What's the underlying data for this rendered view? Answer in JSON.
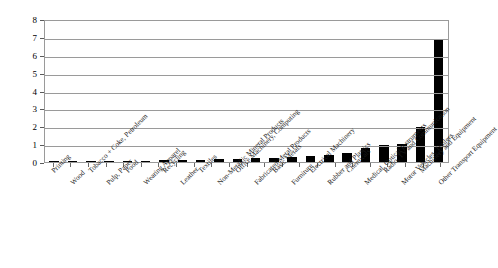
{
  "chart_data": {
    "type": "bar",
    "title": "",
    "subtitle": "",
    "xlabel": "",
    "ylabel": "",
    "ylim": [
      0,
      8
    ],
    "ytick_labels": [
      "8",
      "7",
      "6",
      "5",
      "4",
      "3",
      "2",
      "1",
      "0"
    ],
    "yticks": [
      8,
      7,
      6,
      5,
      4,
      3,
      2,
      1,
      0
    ],
    "grid": true,
    "legend": "none",
    "bar_color": "#000000",
    "categories": [
      "Printing",
      "Wood",
      "Tobacco + Coke, Petroleum",
      "Pulp, Paper",
      "Food",
      "Wearing Apparel",
      "Recycling",
      "Leather",
      "Textiles",
      "Non-Metallic Mineral Products",
      "Office Machinery, Computing",
      "Fabricated Metal Products",
      "Basic Metals",
      "Furniture",
      "Electrical Machinery",
      "Rubber and Plastics",
      "Chemicals",
      "Medical, Optical Instruments",
      "Radio, TV and Communication",
      "Motor Vehicles, Trailers",
      "Machinery and Equipment",
      "Other Transport Equipment"
    ],
    "values": [
      0.02,
      0.03,
      0.04,
      0.05,
      0.07,
      0.08,
      0.1,
      0.12,
      0.13,
      0.15,
      0.18,
      0.2,
      0.24,
      0.3,
      0.34,
      0.42,
      0.5,
      0.78,
      0.95,
      1.0,
      1.95,
      5.95
    ],
    "values_note": "heights read against gridlines 0-8",
    "last_value": 6.85
  }
}
